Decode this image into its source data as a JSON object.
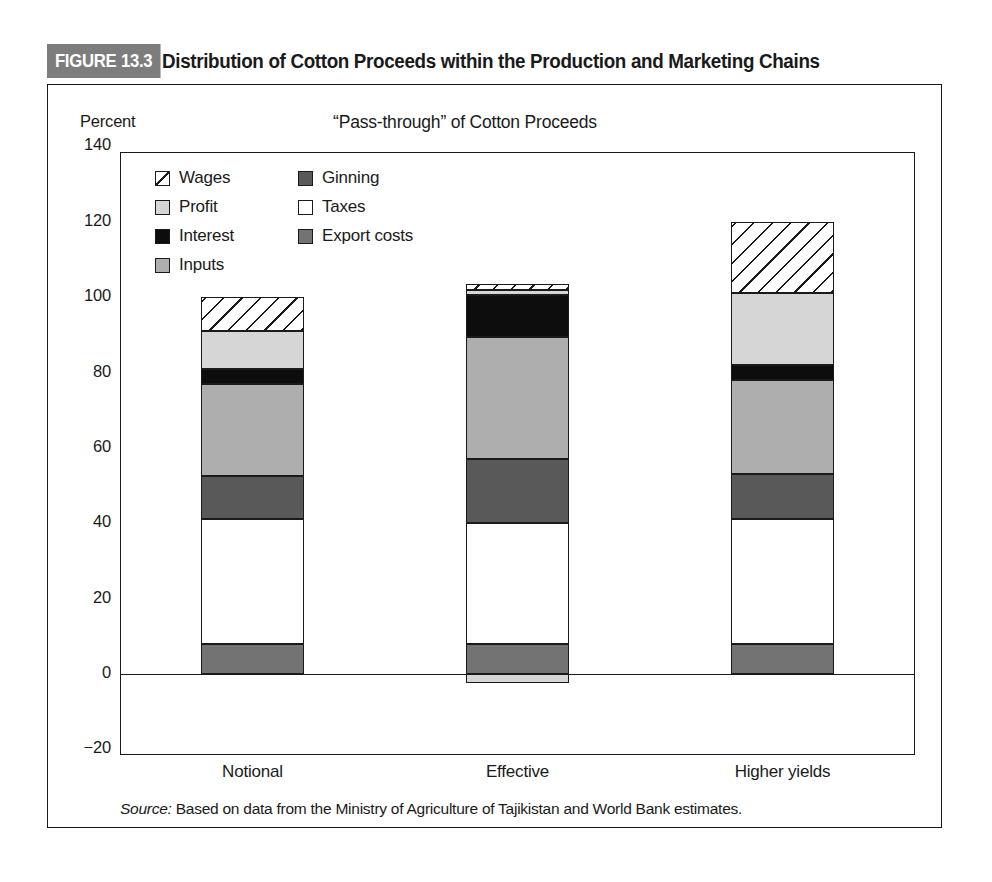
{
  "figure": {
    "badge": "FIGURE 13.3",
    "title": "Distribution of Cotton Proceeds within the Production and Marketing Chains",
    "source_label": "Source:",
    "source_text": " Based on data from the Ministry of Agriculture of Tajikistan and World Bank estimates."
  },
  "chart_data": {
    "type": "bar",
    "subtype": "stacked",
    "title": "“Pass-through” of Cotton Proceeds",
    "xlabel": "",
    "ylabel": "Percent",
    "ylim": [
      -20,
      140
    ],
    "ytick_step": 20,
    "yticks": [
      "140",
      "120",
      "100",
      "80",
      "60",
      "40",
      "20",
      "0",
      "−20"
    ],
    "grid": false,
    "legend_position": "inside-top-left",
    "categories": [
      "Notional",
      "Effective",
      "Higher yields"
    ],
    "stack_order_bottom_up": [
      "Export costs",
      "Taxes",
      "Ginning",
      "Inputs",
      "Interest",
      "Profit",
      "Wages"
    ],
    "series": [
      {
        "name": "Export costs",
        "color": "#737373",
        "values": [
          8,
          8,
          8
        ]
      },
      {
        "name": "Taxes",
        "color": "#ffffff",
        "values": [
          33,
          32,
          33
        ]
      },
      {
        "name": "Ginning",
        "color": "#595959",
        "values": [
          11.5,
          17,
          12
        ]
      },
      {
        "name": "Inputs",
        "color": "#aeaeae",
        "values": [
          24.5,
          32.5,
          25
        ]
      },
      {
        "name": "Interest",
        "color": "#0d0d0d",
        "values": [
          4,
          11,
          4
        ]
      },
      {
        "name": "Profit",
        "color": "#d6d6d6",
        "values": [
          10,
          1.5,
          19
        ]
      },
      {
        "name": "Wages",
        "color": "#ffffff",
        "hatch": "diagonal",
        "values": [
          9,
          1.5,
          19
        ]
      }
    ],
    "negative_segments": [
      {
        "category": "Effective",
        "name": "Profit",
        "value": -2.5,
        "color": "#d6d6d6"
      }
    ],
    "totals": [
      100,
      102,
      120
    ]
  },
  "legend": {
    "items": [
      {
        "label": "Wages",
        "swatch": "hatch"
      },
      {
        "label": "Ginning",
        "swatch": "#595959"
      },
      {
        "label": "Profit",
        "swatch": "#d6d6d6"
      },
      {
        "label": "Taxes",
        "swatch": "#ffffff"
      },
      {
        "label": "Interest",
        "swatch": "#0d0d0d"
      },
      {
        "label": "Export costs",
        "swatch": "#737373"
      },
      {
        "label": "Inputs",
        "swatch": "#aeaeae"
      }
    ]
  }
}
